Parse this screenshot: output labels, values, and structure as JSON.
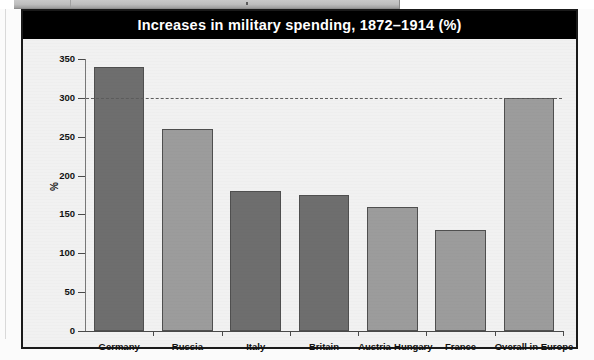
{
  "figure": {
    "title": "Increases in military spending, 1872–1914 (%)",
    "title_bar_color": "#000000",
    "title_text_color": "#ffffff",
    "frame_color": "#1a1a1a",
    "plot_background": "#f1f1f1"
  },
  "axes": {
    "y_label": "%",
    "y_ticks": [
      "0",
      "50",
      "100",
      "150",
      "200",
      "250",
      "300",
      "350"
    ],
    "x_tick_labels": [
      "Germany",
      "Russia",
      "Italy",
      "Britain",
      "Austria-Hungary",
      "France",
      "Overall in Europe"
    ]
  },
  "reference_line": {
    "value": 300,
    "style": "dashed",
    "color": "#5c5c5c"
  },
  "colors": {
    "bar_dark": "#6e6e6e",
    "bar_light": "#9c9c9c",
    "bar_outline": "#4f4f4f",
    "axis": "#4a4a4a"
  },
  "chart_data": {
    "type": "bar",
    "title": "Increases in military spending, 1872–1914 (%)",
    "xlabel": "",
    "ylabel": "%",
    "ylim": [
      0,
      350
    ],
    "ytick_values": [
      0,
      50,
      100,
      150,
      200,
      250,
      300,
      350
    ],
    "grid": false,
    "legend": null,
    "annotations": [
      {
        "type": "hline",
        "y": 300,
        "style": "dashed",
        "label": ""
      }
    ],
    "categories": [
      "Germany",
      "Russia",
      "Italy",
      "Britain",
      "Austria-Hungary",
      "France",
      "Overall in Europe"
    ],
    "values": [
      340,
      260,
      180,
      175,
      160,
      130,
      300
    ],
    "bar_colors": [
      "#6e6e6e",
      "#9c9c9c",
      "#6e6e6e",
      "#6e6e6e",
      "#9c9c9c",
      "#9c9c9c",
      "#9c9c9c"
    ]
  }
}
